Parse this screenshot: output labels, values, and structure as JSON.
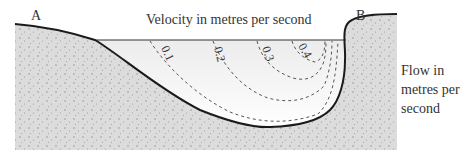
{
  "diagram": {
    "title": "Velocity in metres per second",
    "bank_labels": {
      "left": "A",
      "right": "B"
    },
    "side_label": "Flow in metres per second",
    "side_label_lines": [
      "Flow in",
      "metres per",
      "second"
    ],
    "contours": [
      {
        "label": "0.1"
      },
      {
        "label": "0.2"
      },
      {
        "label": "0.3"
      },
      {
        "label": "0.4"
      }
    ],
    "colors": {
      "ground_fill": "#d9d9d9",
      "ground_dots": "#8a8a8a",
      "water_fill": "#f4f4f4",
      "bed_line": "#1a1a1a",
      "contour_line": "#555555",
      "text": "#333333"
    }
  }
}
